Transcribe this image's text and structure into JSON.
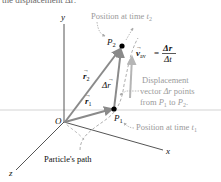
{
  "header_fragment": "the displacement Δr:",
  "axes": {
    "x_label": "x",
    "y_label": "y",
    "z_label": "z",
    "origin_label": "O"
  },
  "points": {
    "p1": {
      "name": "P",
      "sub": "1"
    },
    "p2": {
      "name": "P",
      "sub": "2"
    }
  },
  "vectors": {
    "r1": {
      "symbol": "r",
      "sub": "1"
    },
    "r2": {
      "symbol": "r",
      "sub": "2"
    },
    "delta_r": {
      "symbol": "Δr"
    },
    "v_av": {
      "symbol": "v",
      "sub": "av",
      "eq": "=",
      "numerator": "Δr",
      "denominator": "Δt"
    }
  },
  "annotations": {
    "position_t2": {
      "text": "Position at time ",
      "t": "t",
      "sub": "2"
    },
    "position_t1": {
      "text": "Position at time ",
      "t": "t",
      "sub": "1"
    },
    "displacement_line1": "Displacement",
    "displacement_line2_a": "vector ",
    "displacement_line2_sym": "Δr",
    "displacement_line2_b": " points",
    "displacement_line3_a": "from ",
    "displacement_line3_p1": "P",
    "displacement_line3_s1": "1",
    "displacement_line3_mid": " to ",
    "displacement_line3_p2": "P",
    "displacement_line3_s2": "2",
    "displacement_line3_end": ".",
    "path_label": "Particle's path"
  },
  "colors": {
    "vector": "#8a8a8a",
    "axis": "#555555",
    "point": "#000000",
    "annotation": "#9a9a9a",
    "path": "#b0b0b0"
  }
}
